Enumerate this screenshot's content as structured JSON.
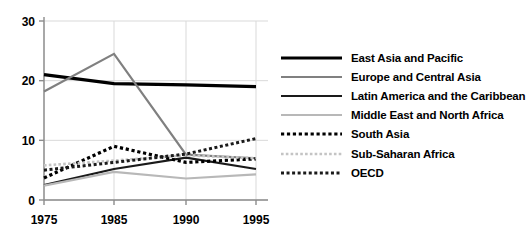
{
  "chart_data": {
    "type": "line",
    "title": "",
    "xlabel": "",
    "ylabel": "",
    "categories": [
      "1975",
      "1985",
      "1990",
      "1995"
    ],
    "xtick_labels": [
      "1975",
      "1985",
      "1990",
      "1995"
    ],
    "ytick_labels": [
      "0",
      "10",
      "20",
      "30"
    ],
    "yticks": [
      0,
      10,
      20,
      30
    ],
    "ylim": [
      0,
      30
    ],
    "grid": true,
    "legend_position": "right",
    "series": [
      {
        "name": "East Asia and Pacific",
        "values": [
          21.0,
          19.5,
          19.3,
          19.0
        ],
        "color": "#000000",
        "style": "solid",
        "width": 3.2
      },
      {
        "name": "Europe and Central Asia",
        "values": [
          18.2,
          24.5,
          7.6,
          7.0
        ],
        "color": "#808080",
        "style": "solid",
        "width": 2.2
      },
      {
        "name": "Latin America and the Caribbean",
        "values": [
          2.5,
          5.2,
          7.1,
          5.2
        ],
        "color": "#1a1a1a",
        "style": "solid",
        "width": 2.2
      },
      {
        "name": "Middle East and North Africa",
        "values": [
          2.4,
          4.7,
          3.6,
          4.3
        ],
        "color": "#b8b8b8",
        "style": "solid",
        "width": 2.2
      },
      {
        "name": "South Asia",
        "values": [
          3.7,
          9.0,
          6.3,
          6.9
        ],
        "color": "#000000",
        "style": "dotted",
        "width": 3.2
      },
      {
        "name": "Sub-Saharan Africa",
        "values": [
          5.8,
          6.6,
          7.5,
          7.0
        ],
        "color": "#c4c4c4",
        "style": "dotted",
        "width": 2.6
      },
      {
        "name": "OECD",
        "values": [
          5.0,
          6.3,
          7.7,
          10.3
        ],
        "color": "#1a1a1a",
        "style": "dotted",
        "width": 3.0
      }
    ]
  },
  "legend": {
    "items": [
      {
        "label": "East Asia and Pacific"
      },
      {
        "label": "Europe and Central Asia"
      },
      {
        "label": "Latin America and the Caribbean"
      },
      {
        "label": "Middle East and North Africa"
      },
      {
        "label": "South Asia"
      },
      {
        "label": "Sub-Saharan Africa"
      },
      {
        "label": "OECD"
      }
    ]
  }
}
